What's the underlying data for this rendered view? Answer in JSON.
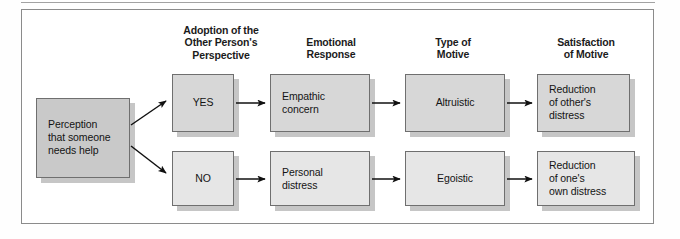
{
  "figure": {
    "headings": [
      {
        "id": "adoption",
        "lines": [
          "Adoption of the",
          "Other Person's",
          "Perspective"
        ]
      },
      {
        "id": "emotional",
        "lines": [
          "Emotional",
          "Response"
        ]
      },
      {
        "id": "motive_type",
        "lines": [
          "Type of",
          "Motive"
        ]
      },
      {
        "id": "satisfaction",
        "lines": [
          "Satisfaction",
          "of Motive"
        ]
      }
    ],
    "nodes": {
      "perception": {
        "lines": [
          "Perception",
          "that someone",
          "needs help"
        ]
      },
      "yes": {
        "lines": [
          "YES"
        ]
      },
      "no": {
        "lines": [
          "NO"
        ]
      },
      "empathic": {
        "lines": [
          "Empathic",
          "concern"
        ]
      },
      "personal": {
        "lines": [
          "Personal",
          "distress"
        ]
      },
      "altruistic": {
        "lines": [
          "Altruistic"
        ]
      },
      "egoistic": {
        "lines": [
          "Egoistic"
        ]
      },
      "reduction_other": {
        "lines": [
          "Reduction",
          "of other's",
          "distress"
        ]
      },
      "reduction_own": {
        "lines": [
          "Reduction",
          "of one's",
          "own distress"
        ]
      }
    },
    "colors": {
      "fill_dark": "#c9c9c9",
      "fill_mid": "#d7d7d7",
      "fill_light": "#e6e6e6",
      "stroke": "#6f6f6f",
      "shadow": "#c6c6c6",
      "text": "#141414",
      "frame": "#8b8b8b"
    },
    "arrows": [
      {
        "from": "perception",
        "to": "yes"
      },
      {
        "from": "perception",
        "to": "no"
      },
      {
        "from": "yes",
        "to": "empathic"
      },
      {
        "from": "no",
        "to": "personal"
      },
      {
        "from": "empathic",
        "to": "altruistic"
      },
      {
        "from": "personal",
        "to": "egoistic"
      },
      {
        "from": "altruistic",
        "to": "reduction_other"
      },
      {
        "from": "egoistic",
        "to": "reduction_own"
      }
    ]
  }
}
